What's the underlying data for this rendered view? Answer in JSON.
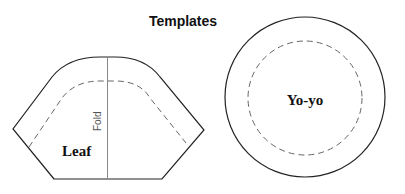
{
  "title": "Templates",
  "templates": [
    {
      "name": "leaf",
      "label": "Leaf",
      "fold_label": "Fold"
    },
    {
      "name": "yoyo",
      "label": "Yo-yo"
    }
  ],
  "colors": {
    "outline": "#222222",
    "dashed": "#666666",
    "fold_line": "#888888"
  }
}
